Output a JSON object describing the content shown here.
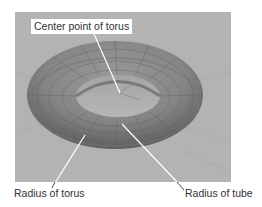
{
  "figure": {
    "subject": "torus",
    "background_color": "#b3b3b3",
    "labels": {
      "center": "Center point of torus",
      "torus_radius": "Radius of torus",
      "tube_radius": "Radius of tube"
    }
  }
}
